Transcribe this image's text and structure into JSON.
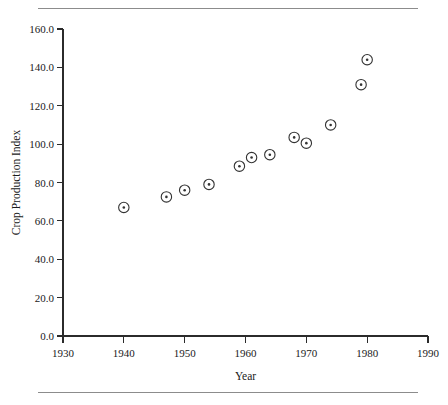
{
  "chart_data": {
    "type": "scatter",
    "title": "",
    "xlabel": "Year",
    "ylabel": "Crop Production Index",
    "xlim": [
      1930,
      1990
    ],
    "ylim": [
      0.0,
      160.0
    ],
    "grid": false,
    "legend": null,
    "x_ticks": [
      "1930",
      "1940",
      "1950",
      "1960",
      "1970",
      "1980",
      "1990"
    ],
    "x_tick_values": [
      1930,
      1940,
      1950,
      1960,
      1970,
      1980,
      1990
    ],
    "y_ticks": [
      "0.0",
      "20.0",
      "40.0",
      "60.0",
      "80.0",
      "100.0",
      "120.0",
      "140.0",
      "160.0"
    ],
    "y_tick_values": [
      0.0,
      20.0,
      40.0,
      60.0,
      80.0,
      100.0,
      120.0,
      140.0,
      160.0
    ],
    "marker": "circle-with-center-dot",
    "points": [
      {
        "x": 1940,
        "y": 67.0
      },
      {
        "x": 1947,
        "y": 72.5
      },
      {
        "x": 1950,
        "y": 76.0
      },
      {
        "x": 1954,
        "y": 79.0
      },
      {
        "x": 1959,
        "y": 88.5
      },
      {
        "x": 1961,
        "y": 93.0
      },
      {
        "x": 1964,
        "y": 94.5
      },
      {
        "x": 1968,
        "y": 103.5
      },
      {
        "x": 1970,
        "y": 100.5
      },
      {
        "x": 1974,
        "y": 110.0
      },
      {
        "x": 1979,
        "y": 131.0
      },
      {
        "x": 1980,
        "y": 144.0
      }
    ]
  },
  "figure": {
    "top_rule": "horizontal-rule",
    "bottom_rule": "horizontal-rule"
  }
}
